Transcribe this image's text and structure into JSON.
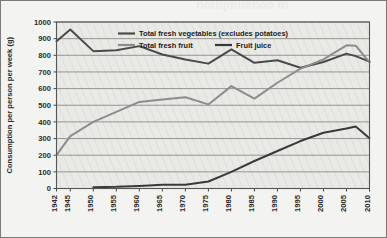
{
  "figure": {
    "background_color": "#f3f3f1",
    "plot_background_color": "#e9e9e6",
    "border_color": "#7a7a78",
    "ghost_text": "in consumption"
  },
  "chart_data": {
    "type": "line",
    "title": "",
    "xlabel": "",
    "ylabel": "Consumption per person per week (g)",
    "ylim": [
      0,
      1000
    ],
    "ytick_step": 100,
    "yticks": [
      "0",
      "100",
      "200",
      "300",
      "400",
      "500",
      "600",
      "700",
      "800",
      "900",
      "1000"
    ],
    "xlim": [
      1942,
      2010
    ],
    "xticks": [
      "1942",
      "1945",
      "1950",
      "1955",
      "1960",
      "1965",
      "1970",
      "1975",
      "1980",
      "1985",
      "1990",
      "1995",
      "2000",
      "2005",
      "2010"
    ],
    "grid": "horizontal",
    "legend_position": "top-inside",
    "series": [
      {
        "name": "Total fresh vegetables (excludes potatoes)",
        "color": "#4a4a4a",
        "width": 2.0,
        "x": [
          1942,
          1945,
          1950,
          1955,
          1960,
          1965,
          1970,
          1975,
          1980,
          1985,
          1990,
          1995,
          2000,
          2005,
          2007,
          2010
        ],
        "values": [
          885,
          955,
          825,
          830,
          855,
          805,
          775,
          750,
          835,
          755,
          770,
          725,
          760,
          810,
          795,
          762
        ]
      },
      {
        "name": "Total fresh fruit",
        "color": "#8d8d8d",
        "width": 2.0,
        "x": [
          1942,
          1945,
          1950,
          1955,
          1960,
          1965,
          1970,
          1975,
          1980,
          1985,
          1990,
          1995,
          2000,
          2005,
          2007,
          2010
        ],
        "values": [
          200,
          315,
          400,
          460,
          520,
          535,
          548,
          505,
          615,
          540,
          635,
          720,
          775,
          860,
          858,
          758
        ]
      },
      {
        "name": "Fruit juice",
        "color": "#3a3a3a",
        "width": 2.0,
        "x": [
          1950,
          1955,
          1960,
          1965,
          1970,
          1975,
          1980,
          1985,
          1990,
          1995,
          2000,
          2005,
          2007,
          2010
        ],
        "values": [
          8,
          10,
          15,
          22,
          22,
          42,
          100,
          165,
          225,
          285,
          335,
          360,
          372,
          302
        ]
      }
    ],
    "legend": [
      {
        "label": "Total fresh vegetables (excludes potatoes)",
        "color": "#4a4a4a"
      },
      {
        "label": "Total fresh fruit",
        "color": "#8d8d8d"
      },
      {
        "label": "Fruit juice",
        "color": "#3a3a3a"
      }
    ]
  }
}
